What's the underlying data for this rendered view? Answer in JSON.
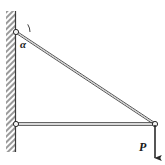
{
  "figure": {
    "background_color": "#ffffff",
    "line_color": "#2b2b2b",
    "hatch_color": "#8a8a8a",
    "joint_fill": "#f2f2f2",
    "width": 165,
    "height": 165
  },
  "labels": {
    "angle": "α",
    "load": "P"
  },
  "geometry": {
    "wall": {
      "x_left": 6,
      "x_right": 15,
      "y_top": 11,
      "y_bottom": 152,
      "hatch_angle_deg": 45
    },
    "joints": [
      {
        "name": "top-pin",
        "x": 16,
        "y": 32,
        "radius": 2.6
      },
      {
        "name": "bottom-pin",
        "x": 16,
        "y": 124,
        "radius": 2.6
      },
      {
        "name": "right-node",
        "x": 155,
        "y": 124,
        "radius": 2.6
      }
    ],
    "members": [
      {
        "name": "diagonal-tie",
        "x1": 16,
        "y1": 32,
        "x2": 155,
        "y2": 124
      },
      {
        "name": "horizontal-strut",
        "x1": 16,
        "y1": 124,
        "x2": 155,
        "y2": 124
      }
    ],
    "angle_arc": {
      "center_x": 16,
      "center_y": 32,
      "radius": 14,
      "start_deg": 0,
      "end_deg": 33
    },
    "load_arrow": {
      "x": 155,
      "y_start": 124,
      "y_end": 160,
      "direction": "down"
    }
  }
}
